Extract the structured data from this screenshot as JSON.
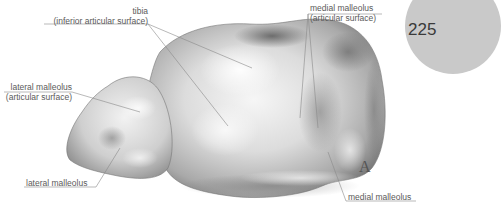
{
  "page": {
    "number": "225",
    "figure_letter": "A",
    "accent_disc_color": "#c9c9c9"
  },
  "labels": {
    "tibia": {
      "line1": "tibia",
      "line2": "(inferior articular surface)"
    },
    "medial_malleolus_articular": {
      "line1": "medial malleolus",
      "line2": "(articular surface)"
    },
    "lateral_malleolus_articular": {
      "line1": "lateral malleolus",
      "line2": "(articular surface)"
    },
    "lateral_malleolus": {
      "line1": "lateral malleolus"
    },
    "medial_malleolus": {
      "line1": "medial malleolus"
    }
  },
  "illustration": {
    "subject": "talus-superior-view",
    "shading": "grayscale"
  }
}
